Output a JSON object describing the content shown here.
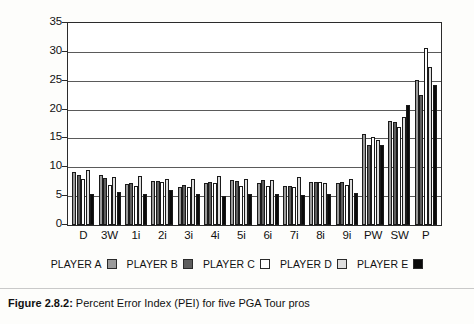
{
  "chart_data": {
    "type": "bar",
    "title": "",
    "xlabel": "",
    "ylabel": "",
    "ylim": [
      0,
      35
    ],
    "yticks": [
      0,
      5,
      10,
      15,
      20,
      25,
      30,
      35
    ],
    "grid": true,
    "legend_position": "bottom",
    "categories": [
      "D",
      "3W",
      "1i",
      "2i",
      "3i",
      "4i",
      "5i",
      "6i",
      "7i",
      "8i",
      "9i",
      "PW",
      "SW",
      "P"
    ],
    "series": [
      {
        "name": "PLAYER A",
        "color": "#9a9a9a",
        "values": [
          9.2,
          8.6,
          7.1,
          7.7,
          6.6,
          7.3,
          7.8,
          7.3,
          6.7,
          7.5,
          7.2,
          15.8,
          18.0,
          25.2
        ]
      },
      {
        "name": "PLAYER B",
        "color": "#5e5e5e",
        "values": [
          8.6,
          8.2,
          7.2,
          7.7,
          7.0,
          7.5,
          7.7,
          7.8,
          6.8,
          7.5,
          7.4,
          13.8,
          17.8,
          22.6
        ]
      },
      {
        "name": "PLAYER C",
        "color": "#ffffff",
        "values": [
          8.0,
          7.0,
          6.8,
          7.5,
          6.6,
          7.2,
          6.8,
          6.7,
          6.6,
          7.4,
          7.0,
          15.2,
          17.0,
          30.7
        ]
      },
      {
        "name": "PLAYER D",
        "color": "#dedede",
        "values": [
          9.5,
          8.3,
          8.5,
          8.0,
          7.9,
          8.5,
          7.9,
          7.8,
          8.4,
          7.2,
          7.9,
          14.8,
          18.7,
          27.3
        ]
      },
      {
        "name": "PLAYER E",
        "color": "#0a0a0a",
        "values": [
          5.4,
          5.7,
          5.4,
          6.1,
          5.3,
          5.1,
          5.3,
          5.4,
          5.2,
          5.3,
          5.6,
          13.8,
          20.8,
          24.3
        ]
      }
    ]
  },
  "legend": {
    "items": [
      {
        "label": "PLAYER A",
        "color": "#9a9a9a"
      },
      {
        "label": "PLAYER B",
        "color": "#5e5e5e"
      },
      {
        "label": "PLAYER C",
        "color": "#ffffff"
      },
      {
        "label": "PLAYER D",
        "color": "#dedede"
      },
      {
        "label": "PLAYER E",
        "color": "#0a0a0a"
      }
    ]
  },
  "caption": {
    "figure_number": "Figure 2.8.2:",
    "text": " Percent Error Index (PEI) for five PGA Tour pros"
  }
}
